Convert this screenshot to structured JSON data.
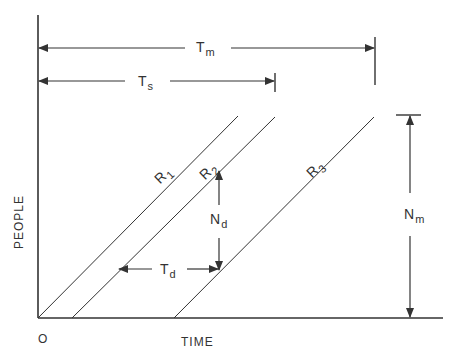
{
  "diagram": {
    "axes": {
      "x_label": "TIME",
      "y_label": "PEOPLE",
      "origin_label": "O"
    },
    "lines": [
      {
        "id": "R1",
        "main": "R",
        "sub": "1"
      },
      {
        "id": "R2",
        "main": "R",
        "sub": "2"
      },
      {
        "id": "R3",
        "main": "R",
        "sub": "3"
      }
    ],
    "dimensions": {
      "tm": {
        "main": "T",
        "sub": "m"
      },
      "ts": {
        "main": "T",
        "sub": "s"
      },
      "td": {
        "main": "T",
        "sub": "d"
      },
      "nd": {
        "main": "N",
        "sub": "d"
      },
      "nm": {
        "main": "N",
        "sub": "m"
      }
    },
    "colors": {
      "ink": "#333333",
      "background": "#ffffff"
    }
  }
}
